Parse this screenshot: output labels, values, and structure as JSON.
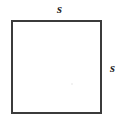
{
  "figure": {
    "name": "square-with-side-labels",
    "background_color": "#ffffff",
    "shape": {
      "type": "square",
      "stroke_color": "#3b3b3b",
      "fill_color": "#ffffff",
      "stroke_width_px": 2,
      "side_length_px": 91
    },
    "labels": {
      "top": "s",
      "right": "s"
    }
  }
}
